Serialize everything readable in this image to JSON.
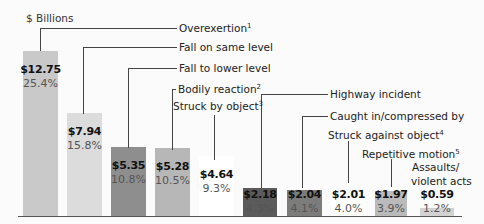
{
  "chart_data": {
    "type": "bar",
    "title": "",
    "ylabel": "$ Billions",
    "xlabel": "",
    "categories": [
      "Overexertion",
      "Fall on same level",
      "Fall to lower level",
      "Bodily reaction",
      "Struck by object",
      "Highway incident",
      "Caught in/compressed by",
      "Struck against object",
      "Repetitive motion",
      "Assaults/ violent acts"
    ],
    "footnotes": [
      "1",
      "",
      "",
      "2",
      "3",
      "",
      "",
      "4",
      "5",
      ""
    ],
    "values": [
      12.75,
      7.94,
      5.35,
      5.28,
      4.64,
      2.18,
      2.04,
      2.01,
      1.97,
      0.59
    ],
    "value_labels": [
      "$12.75",
      "$7.94",
      "$5.35",
      "$5.28",
      "$4.64",
      "$2.18",
      "$2.04",
      "$2.01",
      "$1.97",
      "$0.59"
    ],
    "percents": [
      "25.4%",
      "15.8%",
      "10.8%",
      "10.5%",
      "9.3%",
      "4.3%",
      "4.1%",
      "4.0%",
      "3.9%",
      "1.2%"
    ],
    "bar_colors": [
      "#c9c9c9",
      "#dcdcdc",
      "#8e8e8e",
      "#b7b7b7",
      "#ffffff",
      "#5b5b5b",
      "#7c7c7c",
      "#ffffff",
      "#bababa",
      "#d2d2d2"
    ],
    "grid": false,
    "legend": "none (leader-line labels)"
  },
  "unit_label": "$ Billions",
  "labels": {
    "l0": "Overexertion",
    "s0": "1",
    "l1": "Fall on same level",
    "l2": "Fall to lower level",
    "l3": "Bodily reaction",
    "s3": "2",
    "l4": "Struck by object",
    "s4": "3",
    "l5": "Highway incident",
    "l6": "Caught in/compressed by",
    "l7": "Struck against object",
    "s7": "4",
    "l8": "Repetitive motion",
    "s8": "5",
    "l9a": "Assaults/",
    "l9b": "violent acts"
  }
}
